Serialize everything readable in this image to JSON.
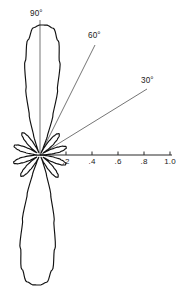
{
  "figure": {
    "title": "",
    "background_color": "#ffffff",
    "curve_color": "#111111",
    "axis_color": "#2b2b2b",
    "label_color": "#1a1a1a"
  },
  "geometry": {
    "origin_x": 40,
    "origin_y": 155,
    "pixels_per_unit": 130,
    "axis_end_x": 172,
    "vertical_line_top_y": 20,
    "line_60_end": {
      "x": 95,
      "y": 45
    },
    "line_30_end": {
      "x": 147,
      "y": 89
    }
  },
  "radial_axis": {
    "label": "",
    "ticks": [
      {
        "value": 0.2,
        "label": ".2"
      },
      {
        "value": 0.4,
        "label": ".4"
      },
      {
        "value": 0.6,
        "label": ".6"
      },
      {
        "value": 0.8,
        "label": ".8"
      },
      {
        "value": 1.0,
        "label": "1.0"
      }
    ],
    "range": [
      0,
      1.05
    ]
  },
  "angle_lines": [
    {
      "id": "angle-90",
      "label": "90°",
      "angle_deg": 90,
      "label_x": 30,
      "label_y": 16
    },
    {
      "id": "angle-60",
      "label": "60°",
      "angle_deg": 60,
      "label_x": 88,
      "label_y": 38
    },
    {
      "id": "angle-30",
      "label": "30°",
      "angle_deg": 30,
      "label_x": 141,
      "label_y": 83
    }
  ],
  "chart_data": {
    "type": "line",
    "subtype": "polar-radiation-pattern",
    "title": "",
    "xlabel": "",
    "ylabel": "",
    "grid": false,
    "legend": null,
    "angle_unit": "degrees",
    "angle_reference": "0° along positive horizontal axis; 90° straight up",
    "radial_range": [
      0,
      1.05
    ],
    "radial_ticks": [
      0.2,
      0.4,
      0.6,
      0.8,
      1.0
    ],
    "radial_tick_labels": [
      ".2",
      ".4",
      ".6",
      ".8",
      "1.0"
    ],
    "angle_gridlines_deg": [
      30,
      60,
      90
    ],
    "lobes": [
      {
        "name": "main-lobe-up",
        "peak_angle_deg": 90,
        "peak_radius": 1.0,
        "half_width_deg": 13
      },
      {
        "name": "main-lobe-down",
        "peak_angle_deg": 270,
        "peak_radius": 1.0,
        "half_width_deg": 13
      },
      {
        "name": "side-lobe-ur",
        "peak_angle_deg": 58,
        "peak_radius": 0.22,
        "half_width_deg": 11
      },
      {
        "name": "side-lobe-ul",
        "peak_angle_deg": 122,
        "peak_radius": 0.22,
        "half_width_deg": 11
      },
      {
        "name": "side-lobe-r",
        "peak_angle_deg": 27,
        "peak_radius": 0.21,
        "half_width_deg": 11
      },
      {
        "name": "side-lobe-l",
        "peak_angle_deg": 153,
        "peak_radius": 0.21,
        "half_width_deg": 11
      },
      {
        "name": "side-lobe-lr",
        "peak_angle_deg": 333,
        "peak_radius": 0.21,
        "half_width_deg": 11
      },
      {
        "name": "side-lobe-ll",
        "peak_angle_deg": 207,
        "peak_radius": 0.21,
        "half_width_deg": 11
      },
      {
        "name": "side-lobe-dr",
        "peak_angle_deg": 302,
        "peak_radius": 0.22,
        "half_width_deg": 11
      },
      {
        "name": "side-lobe-dl",
        "peak_angle_deg": 238,
        "peak_radius": 0.22,
        "half_width_deg": 11
      }
    ],
    "theta_deg": [
      0,
      3,
      6,
      9,
      12,
      15,
      18,
      21,
      24,
      27,
      30,
      33,
      36,
      39,
      42,
      45,
      48,
      51,
      54,
      57,
      60,
      63,
      66,
      69,
      72,
      75,
      78,
      81,
      84,
      87,
      90,
      93,
      96,
      99,
      102,
      105,
      108,
      111,
      114,
      117,
      120,
      123,
      126,
      129,
      132,
      135,
      138,
      141,
      144,
      147,
      150,
      153,
      156,
      159,
      162,
      165,
      168,
      171,
      174,
      177,
      180,
      183,
      186,
      189,
      192,
      195,
      198,
      201,
      204,
      207,
      210,
      213,
      216,
      219,
      222,
      225,
      228,
      231,
      234,
      237,
      240,
      243,
      246,
      249,
      252,
      255,
      258,
      261,
      264,
      267,
      270,
      273,
      276,
      279,
      282,
      285,
      288,
      291,
      294,
      297,
      300,
      303,
      306,
      309,
      312,
      315,
      318,
      321,
      324,
      327,
      330,
      333,
      336,
      339,
      342,
      345,
      348,
      351,
      354,
      357
    ],
    "r_values": [
      0.0,
      0.05,
      0.11,
      0.16,
      0.19,
      0.21,
      0.21,
      0.19,
      0.15,
      0.1,
      0.04,
      0.03,
      0.09,
      0.14,
      0.18,
      0.21,
      0.22,
      0.21,
      0.18,
      0.13,
      0.07,
      0.02,
      0.06,
      0.16,
      0.32,
      0.52,
      0.73,
      0.89,
      0.98,
      1.0,
      1.0,
      0.98,
      0.89,
      0.73,
      0.52,
      0.32,
      0.16,
      0.06,
      0.02,
      0.07,
      0.13,
      0.18,
      0.21,
      0.22,
      0.21,
      0.18,
      0.14,
      0.09,
      0.03,
      0.04,
      0.1,
      0.15,
      0.19,
      0.21,
      0.21,
      0.19,
      0.16,
      0.11,
      0.05,
      0.0,
      0.0,
      0.05,
      0.11,
      0.16,
      0.19,
      0.21,
      0.21,
      0.19,
      0.15,
      0.1,
      0.04,
      0.03,
      0.09,
      0.14,
      0.18,
      0.21,
      0.22,
      0.21,
      0.18,
      0.13,
      0.07,
      0.02,
      0.06,
      0.16,
      0.32,
      0.52,
      0.73,
      0.89,
      0.98,
      1.0,
      1.0,
      0.98,
      0.89,
      0.73,
      0.52,
      0.32,
      0.16,
      0.06,
      0.02,
      0.07,
      0.13,
      0.18,
      0.21,
      0.22,
      0.21,
      0.18,
      0.14,
      0.09,
      0.03,
      0.04,
      0.1,
      0.15,
      0.19,
      0.21,
      0.21,
      0.19,
      0.16,
      0.11,
      0.05,
      0.0
    ]
  }
}
